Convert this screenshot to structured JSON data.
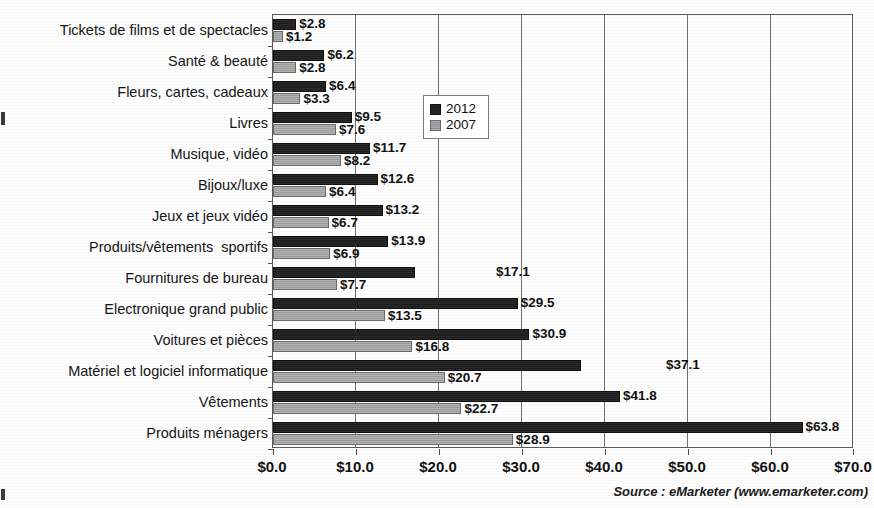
{
  "chart_data": {
    "type": "bar",
    "orientation": "horizontal",
    "title": "",
    "xlabel": "",
    "ylabel": "",
    "xlim": [
      0,
      70
    ],
    "grid": true,
    "grid_axis": "x",
    "legend_position": "center-right-inside",
    "tick_labels": [
      "$0.0",
      "$10.0",
      "$20.0",
      "$30.0",
      "$40.0",
      "$50.0",
      "$60.0",
      "$70.0"
    ],
    "tick_values": [
      0,
      10,
      20,
      30,
      40,
      50,
      60,
      70
    ],
    "categories": [
      "Tickets de films et de spectacles",
      "Santé & beauté",
      "Fleurs, cartes, cadeaux",
      "Livres",
      "Musique, vidéo",
      "Bijoux/luxe",
      "Jeux et jeux vidéo",
      "Produits/vêtements  sportifs",
      "Fournitures de bureau",
      "Electronique grand public",
      "Voitures et pièces",
      "Matériel et logiciel informatique",
      "Vêtements",
      "Produits ménagers"
    ],
    "series": [
      {
        "name": "2012",
        "color": "#242424",
        "values": [
          2.8,
          6.2,
          6.4,
          9.5,
          11.7,
          12.6,
          13.2,
          13.9,
          17.1,
          29.5,
          30.9,
          37.1,
          41.8,
          63.8
        ],
        "labels": [
          "$2.8",
          "$6.2",
          "$6.4",
          "$9.5",
          "$11.7",
          "$12.6",
          "$13.2",
          "$13.9",
          "$17.1",
          "$29.5",
          "$30.9",
          "$37.1",
          "$41.8",
          "$63.8"
        ]
      },
      {
        "name": "2007",
        "color": "#9e9e9e",
        "values": [
          1.2,
          2.8,
          3.3,
          7.6,
          8.2,
          6.4,
          6.7,
          6.9,
          7.7,
          13.5,
          16.8,
          20.7,
          22.7,
          28.9
        ],
        "labels": [
          "$1.2",
          "$2.8",
          "$3.3",
          "$7.6",
          "$8.2",
          "$6.4",
          "$6.7",
          "$6.9",
          "$7.7",
          "$13.5",
          "$16.8",
          "$20.7",
          "$22.7",
          "$28.9"
        ]
      }
    ],
    "legend": [
      {
        "label": "2012",
        "swatch": "dark"
      },
      {
        "label": "2007",
        "swatch": "gray"
      }
    ],
    "annotations": {
      "source": "Source : eMarketer (www.emarketer.com)"
    }
  }
}
